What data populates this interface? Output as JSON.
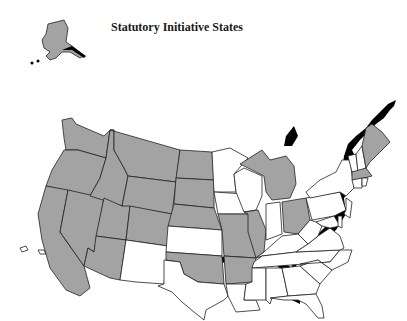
{
  "title": "Statutory Initiative States",
  "legend_colors": {
    "initiative": "#a3a3a3",
    "no_initiative": "#ffffff",
    "border": "#222222",
    "coast_shadow": "#000000"
  },
  "states": {
    "initiative": [
      "AK",
      "WA",
      "OR",
      "CA",
      "NV",
      "ID",
      "MT",
      "WY",
      "UT",
      "AZ",
      "CO",
      "ND",
      "SD",
      "NE",
      "OK",
      "MO",
      "AR",
      "MI",
      "IL",
      "OH",
      "ME",
      "MA"
    ],
    "no_initiative": [
      "HI",
      "MN",
      "WI",
      "IA",
      "KS",
      "NM",
      "TX",
      "LA",
      "MS",
      "AL",
      "GA",
      "FL",
      "SC",
      "NC",
      "TN",
      "KY",
      "IN",
      "WV",
      "VA",
      "PA",
      "NY",
      "VT",
      "NH",
      "CT",
      "RI",
      "NJ",
      "DE",
      "MD"
    ]
  }
}
